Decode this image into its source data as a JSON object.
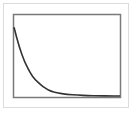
{
  "chart_data": {
    "type": "line",
    "title": "",
    "xlabel": "",
    "ylabel": "",
    "grid": false,
    "legend": null,
    "series": [
      {
        "name": "decay",
        "x": [
          0,
          0.05,
          0.1,
          0.15,
          0.2,
          0.25,
          0.3,
          0.35,
          0.4,
          0.5,
          0.6,
          0.7,
          0.8,
          0.9,
          1.0
        ],
        "values": [
          0.85,
          0.6,
          0.42,
          0.29,
          0.2,
          0.14,
          0.09,
          0.06,
          0.04,
          0.02,
          0.01,
          0.005,
          0.002,
          0.001,
          0.0
        ]
      }
    ],
    "xlim": [
      0,
      1
    ],
    "ylim": [
      0,
      1
    ]
  },
  "colors": {
    "line": "#333333",
    "frame": "#7a7a7a",
    "outer_border": "#dcdcdc"
  }
}
